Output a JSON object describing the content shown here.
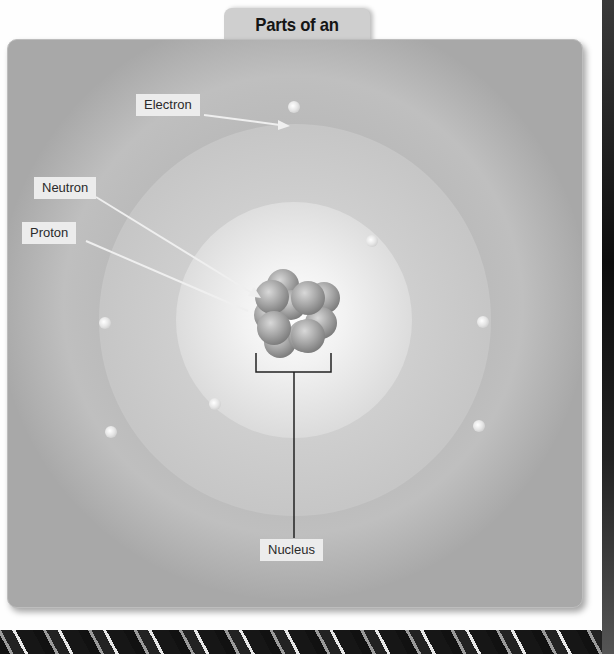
{
  "title": "Parts of an Atom",
  "labels": {
    "electron": "Electron",
    "neutron": "Neutron",
    "proton": "Proton",
    "nucleus": "Nucleus"
  },
  "colors": {
    "panel": "#a8a8a8",
    "tab": "#cfcfcf",
    "label_bg": "#ececec"
  }
}
